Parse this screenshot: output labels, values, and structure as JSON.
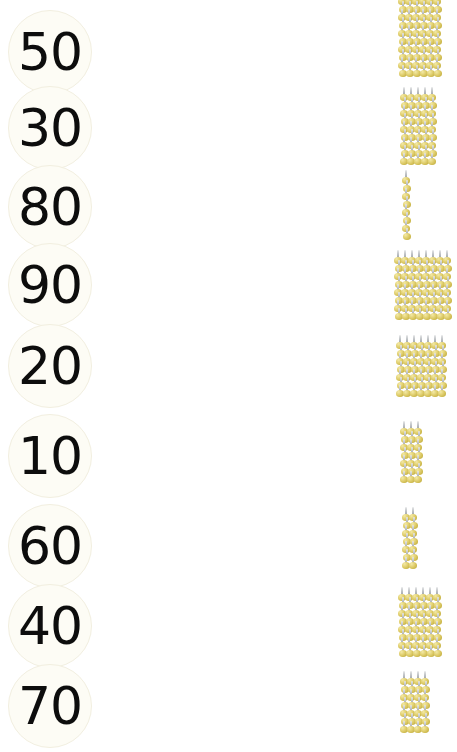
{
  "worksheet": {
    "title": "Number to pin-bundle matching worksheet",
    "background_color": "#ffffff",
    "pin_color": "#d6c35a",
    "pin_head_highlight": "#f3e9a6",
    "pin_needle_color": "#c2c5c8",
    "disc_color": "#fdfcf5",
    "number_color": "#0d0d0d"
  },
  "numbers": [
    {
      "value": "50",
      "top": 8
    },
    {
      "value": "30",
      "top": 84
    },
    {
      "value": "80",
      "top": 163
    },
    {
      "value": "90",
      "top": 241
    },
    {
      "value": "20",
      "top": 322
    },
    {
      "value": "10",
      "top": 412
    },
    {
      "value": "60",
      "top": 502
    },
    {
      "value": "40",
      "top": 582
    },
    {
      "value": "70",
      "top": 662
    }
  ],
  "clusters": [
    {
      "name": "cluster-1",
      "columns": 6,
      "rows": 10,
      "left": 68,
      "top": -4
    },
    {
      "name": "cluster-2",
      "columns": 5,
      "rows": 9,
      "left": 70,
      "top": 92
    },
    {
      "name": "cluster-3",
      "columns": 1,
      "rows": 8,
      "left": 72,
      "top": 175
    },
    {
      "name": "cluster-4",
      "columns": 8,
      "rows": 8,
      "left": 64,
      "top": 255
    },
    {
      "name": "cluster-5",
      "columns": 7,
      "rows": 7,
      "left": 66,
      "top": 340
    },
    {
      "name": "cluster-6",
      "columns": 3,
      "rows": 7,
      "left": 70,
      "top": 426
    },
    {
      "name": "cluster-7",
      "columns": 2,
      "rows": 7,
      "left": 72,
      "top": 512
    },
    {
      "name": "cluster-8",
      "columns": 6,
      "rows": 8,
      "left": 68,
      "top": 592
    },
    {
      "name": "cluster-9",
      "columns": 4,
      "rows": 7,
      "left": 70,
      "top": 676
    }
  ],
  "chart_data": {
    "type": "table",
    "xlabel": "",
    "ylabel": "",
    "columns": [
      "number",
      "bundle_columns",
      "bundle_rows"
    ],
    "rows": [
      [
        "50",
        6,
        10
      ],
      [
        "30",
        5,
        9
      ],
      [
        "80",
        1,
        8
      ],
      [
        "90",
        8,
        8
      ],
      [
        "20",
        7,
        7
      ],
      [
        "10",
        3,
        7
      ],
      [
        "60",
        2,
        7
      ],
      [
        "40",
        6,
        8
      ],
      [
        "70",
        4,
        7
      ]
    ],
    "categories": [
      "50",
      "30",
      "80",
      "90",
      "20",
      "10",
      "60",
      "40",
      "70"
    ],
    "series": [
      {
        "name": "bundle columns",
        "values": [
          6,
          5,
          1,
          8,
          7,
          3,
          2,
          6,
          4
        ]
      },
      {
        "name": "bundle rows",
        "values": [
          10,
          9,
          8,
          8,
          7,
          7,
          7,
          8,
          7
        ]
      }
    ]
  }
}
